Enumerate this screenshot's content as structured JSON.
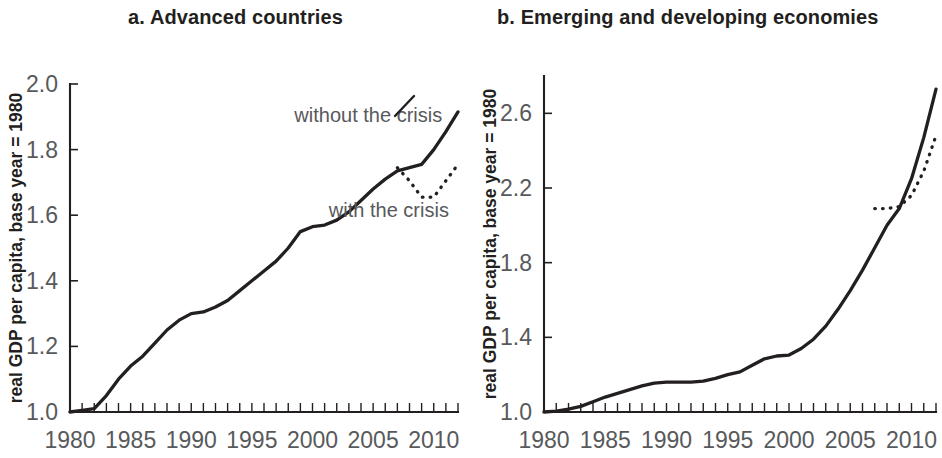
{
  "figure": {
    "background": "#ffffff",
    "line_color": "#231f20",
    "label_color": "#58595b"
  },
  "chart_data": [
    {
      "type": "line",
      "panel": "a",
      "title": "a. Advanced countries",
      "xlabel": "",
      "ylabel": "real GDP per capita, base year = 1980",
      "xlim": [
        1980,
        2012
      ],
      "ylim": [
        1.0,
        2.0
      ],
      "yticks": [
        1.0,
        1.2,
        1.4,
        1.6,
        1.8,
        2.0
      ],
      "ytick_labels": [
        "1.0",
        "1.2",
        "1.4",
        "1.6",
        "1.8",
        "2.0"
      ],
      "xticks": [
        1980,
        1985,
        1990,
        1995,
        2000,
        2005,
        2010
      ],
      "xtick_labels": [
        "1980",
        "1985",
        "1990",
        "1995",
        "2000",
        "2005",
        "2010"
      ],
      "minor_xtick_step": 1,
      "grid": false,
      "legend": "inline annotations",
      "series": [
        {
          "name": "without the crisis",
          "style": "solid",
          "x": [
            1980,
            1981,
            1982,
            1983,
            1984,
            1985,
            1986,
            1987,
            1988,
            1989,
            1990,
            1991,
            1992,
            1993,
            1994,
            1995,
            1996,
            1997,
            1998,
            1999,
            2000,
            2001,
            2002,
            2003,
            2004,
            2005,
            2006,
            2007,
            2008,
            2009,
            2010,
            2011,
            2012
          ],
          "y": [
            1.0,
            1.005,
            1.01,
            1.05,
            1.1,
            1.14,
            1.17,
            1.21,
            1.25,
            1.28,
            1.3,
            1.305,
            1.32,
            1.34,
            1.37,
            1.4,
            1.43,
            1.46,
            1.5,
            1.55,
            1.565,
            1.57,
            1.585,
            1.61,
            1.645,
            1.68,
            1.71,
            1.735,
            1.745,
            1.755,
            1.8,
            1.855,
            1.915
          ]
        },
        {
          "name": "with the crisis",
          "style": "dotted",
          "x": [
            2007,
            2008,
            2009,
            2010,
            2011,
            2012
          ],
          "y": [
            1.745,
            1.705,
            1.655,
            1.655,
            1.705,
            1.755
          ]
        }
      ],
      "annotations": [
        {
          "text": "without the crisis",
          "x": 2004.6,
          "y": 1.885,
          "anchor": "middle"
        },
        {
          "text": "with the crisis",
          "x": 2006.3,
          "y": 1.595,
          "anchor": "middle"
        }
      ]
    },
    {
      "type": "line",
      "panel": "b",
      "title": "b. Emerging and developing economies",
      "xlabel": "",
      "ylabel": "real GDP per capita, base year = 1980",
      "xlim": [
        1980,
        2012
      ],
      "ylim": [
        1.0,
        2.8
      ],
      "yticks": [
        1.0,
        1.4,
        1.8,
        2.2,
        2.6
      ],
      "ytick_labels": [
        "1.0",
        "1.4",
        "1.8",
        "2.2",
        "2.6"
      ],
      "xticks": [
        1980,
        1985,
        1990,
        1995,
        2000,
        2005,
        2010
      ],
      "xtick_labels": [
        "1980",
        "1985",
        "1990",
        "1995",
        "2000",
        "2005",
        "2010"
      ],
      "minor_xtick_step": 1,
      "grid": false,
      "legend": "none",
      "series": [
        {
          "name": "without the crisis",
          "style": "solid",
          "x": [
            1980,
            1981,
            1982,
            1983,
            1984,
            1985,
            1986,
            1987,
            1988,
            1989,
            1990,
            1991,
            1992,
            1993,
            1994,
            1995,
            1996,
            1997,
            1998,
            1999,
            2000,
            2001,
            2002,
            2003,
            2004,
            2005,
            2006,
            2007,
            2008,
            2009,
            2010,
            2011,
            2012
          ],
          "y": [
            1.0,
            1.005,
            1.015,
            1.03,
            1.055,
            1.08,
            1.1,
            1.12,
            1.14,
            1.155,
            1.16,
            1.16,
            1.16,
            1.165,
            1.18,
            1.2,
            1.215,
            1.25,
            1.285,
            1.3,
            1.305,
            1.34,
            1.39,
            1.46,
            1.55,
            1.65,
            1.76,
            1.88,
            2.0,
            2.09,
            2.25,
            2.47,
            2.73
          ]
        },
        {
          "name": "with the crisis",
          "style": "dotted",
          "x": [
            2007,
            2008,
            2009,
            2010,
            2011,
            2012
          ],
          "y": [
            2.09,
            2.09,
            2.1,
            2.16,
            2.29,
            2.48
          ]
        }
      ],
      "annotations": []
    }
  ]
}
